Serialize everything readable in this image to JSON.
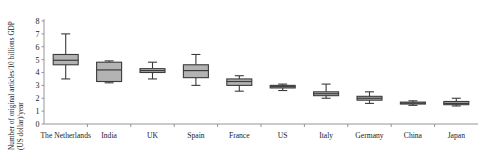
{
  "chart_data": {
    "type": "box",
    "title": "",
    "xlabel": "",
    "ylabel_line1": "Number of original articles/10 billions GDP",
    "ylabel_line2": "(US dollar)/year",
    "ylim": [
      0,
      8
    ],
    "yticks": [
      "0",
      "1",
      "2",
      "3",
      "4",
      "5",
      "6",
      "7",
      "8"
    ],
    "grid": false,
    "legend": "none",
    "categories": [
      "The Netherlands",
      "India",
      "UK",
      "Spain",
      "France",
      "US",
      "Italy",
      "Germany",
      "China",
      "Japan"
    ],
    "boxes": [
      {
        "name": "The Netherlands",
        "whisker_low": 3.5,
        "q1": 4.6,
        "median": 4.95,
        "q3": 5.4,
        "whisker_high": 7.0
      },
      {
        "name": "India",
        "whisker_low": 3.2,
        "q1": 3.3,
        "median": 4.2,
        "q3": 4.8,
        "whisker_high": 4.9
      },
      {
        "name": "UK",
        "whisker_low": 3.5,
        "q1": 4.0,
        "median": 4.15,
        "q3": 4.3,
        "whisker_high": 4.8
      },
      {
        "name": "Spain",
        "whisker_low": 3.0,
        "q1": 3.6,
        "median": 4.15,
        "q3": 4.6,
        "whisker_high": 5.4
      },
      {
        "name": "France",
        "whisker_low": 2.55,
        "q1": 3.0,
        "median": 3.3,
        "q3": 3.5,
        "whisker_high": 3.75
      },
      {
        "name": "US",
        "whisker_low": 2.6,
        "q1": 2.8,
        "median": 2.9,
        "q3": 3.0,
        "whisker_high": 3.1
      },
      {
        "name": "Italy",
        "whisker_low": 2.0,
        "q1": 2.2,
        "median": 2.35,
        "q3": 2.5,
        "whisker_high": 3.1
      },
      {
        "name": "Germany",
        "whisker_low": 1.6,
        "q1": 1.85,
        "median": 2.0,
        "q3": 2.15,
        "whisker_high": 2.5
      },
      {
        "name": "China",
        "whisker_low": 1.45,
        "q1": 1.55,
        "median": 1.62,
        "q3": 1.7,
        "whisker_high": 1.8
      },
      {
        "name": "Japan",
        "whisker_low": 1.4,
        "q1": 1.5,
        "median": 1.6,
        "q3": 1.75,
        "whisker_high": 2.0
      }
    ],
    "colors": {
      "box_fill": "#b3b3b3",
      "box_stroke": "#3b3b3b",
      "axis": "#8a8a8a",
      "text": "#1a1a1a"
    }
  }
}
